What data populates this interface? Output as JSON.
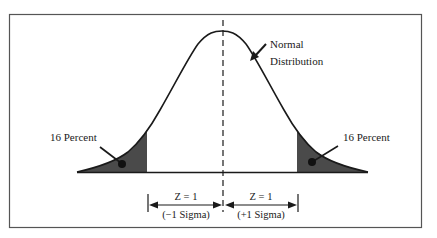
{
  "diagram": {
    "type": "normal-distribution",
    "curve_label": [
      "Normal",
      "Distribution"
    ],
    "left_tail_label": "16 Percent",
    "right_tail_label": "16 Percent",
    "left_interval": {
      "top": "Z = 1",
      "bottom": "(−1 Sigma)"
    },
    "right_interval": {
      "top": "Z = 1",
      "bottom": "(+1 Sigma)"
    },
    "colors": {
      "frame": "#555555",
      "curve": "#1a1a1a",
      "shade": "#4a4a4a",
      "text": "#1a1a1a"
    }
  }
}
